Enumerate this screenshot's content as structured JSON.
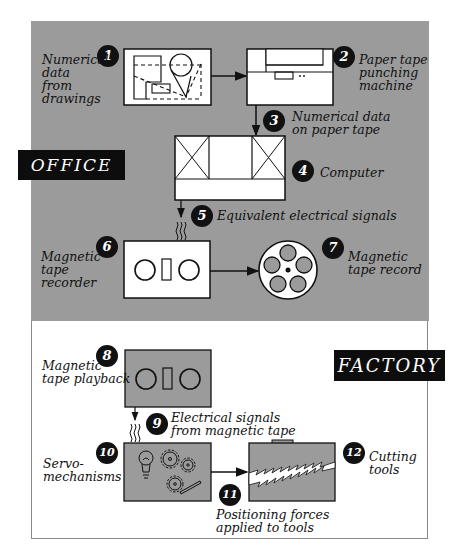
{
  "sections": {
    "office": {
      "label": "OFFICE"
    },
    "factory": {
      "label": "FACTORY"
    }
  },
  "steps": [
    {
      "number": "1",
      "line1": "Numerical",
      "line2": "data from",
      "line3": "drawings"
    },
    {
      "number": "2",
      "line1": "Paper tape",
      "line2": "punching",
      "line3": "machine"
    },
    {
      "number": "3",
      "line1": "Numerical data",
      "line2": "on paper tape"
    },
    {
      "number": "4",
      "line1": "Computer"
    },
    {
      "number": "5",
      "line1": "Equivalent electrical signals"
    },
    {
      "number": "6",
      "line1": "Magnetic",
      "line2": "tape recorder"
    },
    {
      "number": "7",
      "line1": "Magnetic",
      "line2": "tape record"
    },
    {
      "number": "8",
      "line1": "Magnetic",
      "line2": "tape playback"
    },
    {
      "number": "9",
      "line1": "Electrical signals",
      "line2": "from magnetic tape"
    },
    {
      "number": "10",
      "line1": "Servo-",
      "line2": "mechanisms"
    },
    {
      "number": "11",
      "line1": "Positioning forces",
      "line2": "applied to tools"
    },
    {
      "number": "12",
      "line1": "Cutting",
      "line2": "tools"
    }
  ],
  "colors": {
    "office_bg": "#9b9b9b",
    "factory_bg": "#ffffff",
    "label_bg": "#0d0d0d",
    "box_white": "#ffffff",
    "box_gray": "#9b9b9b"
  }
}
